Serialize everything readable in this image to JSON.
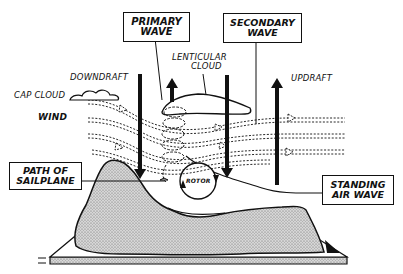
{
  "diagram": {
    "type": "illustration",
    "colors": {
      "ink": "#111111",
      "background": "#ffffff",
      "terrain_fill": "#c8c8c8"
    },
    "boxed_labels": {
      "primary_wave": {
        "line1": "PRIMARY",
        "line2": "WAVE"
      },
      "secondary_wave": {
        "line1": "SECONDARY",
        "line2": "WAVE"
      },
      "path_of_sailplane": {
        "line1": "PATH OF",
        "line2": "SAILPLANE"
      },
      "standing_air_wave": {
        "line1": "STANDING",
        "line2": "AIR WAVE"
      }
    },
    "labels": {
      "lenticular_line1": "LENTICULAR",
      "lenticular_line2": "CLOUD",
      "downdraft": "DOWNDRAFT",
      "updraft": "UPDRAFT",
      "cap_cloud": "CAP CLOUD",
      "wind": "WIND",
      "rotor": "ROTOR"
    },
    "elements": [
      "cap-cloud",
      "lenticular-cloud",
      "wind-streamlines",
      "downdraft-arrows",
      "updraft-arrows",
      "sailplane-spiral-path",
      "rotor-circle",
      "mountain-ridge",
      "ground-slab"
    ]
  }
}
